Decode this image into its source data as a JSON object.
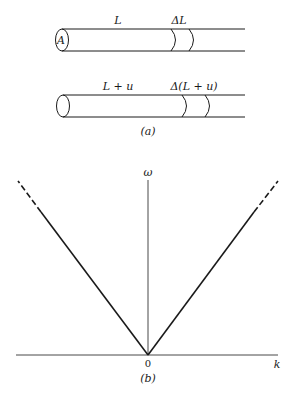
{
  "figure_a": {
    "caption": "(a)",
    "tube_top": {
      "cross_section_label": "A",
      "length_label": "L",
      "element_label": "ΔL"
    },
    "tube_bottom": {
      "length_label": "L + u",
      "element_label": "Δ(L + u)"
    }
  },
  "figure_b": {
    "caption": "(b)",
    "y_axis_label": "ω",
    "x_axis_label": "k",
    "origin_label": "0"
  },
  "colors": {
    "ink": "#1a1a1a",
    "background": "#ffffff"
  }
}
